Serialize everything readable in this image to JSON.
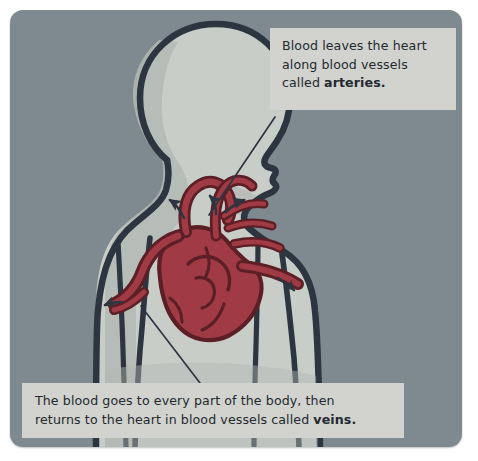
{
  "figure": {
    "kind": "anatomy-diagram",
    "background_color": "#7e8a90",
    "card_radius_px": 13
  },
  "body_figure": {
    "name": "human-upper-body-profile",
    "orientation": "facing right",
    "fill_color": "#c9cdc8",
    "shade_color": "#b3b8b4",
    "outline_color": "#2d3640"
  },
  "heart": {
    "name": "heart-illustration",
    "fill_color": "#a03a44",
    "vessel_fill_color": "#8e3039",
    "outline_color": "#5c1f26"
  },
  "annotations": {
    "artery": {
      "id": "artery-callout",
      "box_color": "#d2d3ce",
      "lines": [
        "Blood leaves the heart",
        "along blood vessels",
        "called "
      ],
      "bold_term": "arteries.",
      "full_text": "Blood leaves the heart along blood vessels called arteries."
    },
    "vein": {
      "id": "vein-callout",
      "box_color": "#d2d3ce",
      "lines": [
        "The blood goes to every part of the body, then",
        "returns to the heart in blood vessels called "
      ],
      "bold_term": "veins.",
      "full_text": "The blood goes to every part of the body, then returns to the heart in blood vessels called veins."
    }
  },
  "flow_arrows": {
    "name": "blood-flow-arrows",
    "color": "#2d3640",
    "count": 5,
    "description": "small curved arrows showing blood entering and leaving the heart"
  },
  "leader_lines": {
    "color": "#2d3640",
    "artery_line": "from artery callout box down-left to the aorta at the top of the heart",
    "vein_line": "from the vena cava at the left of the heart down-right to the vein callout box"
  }
}
